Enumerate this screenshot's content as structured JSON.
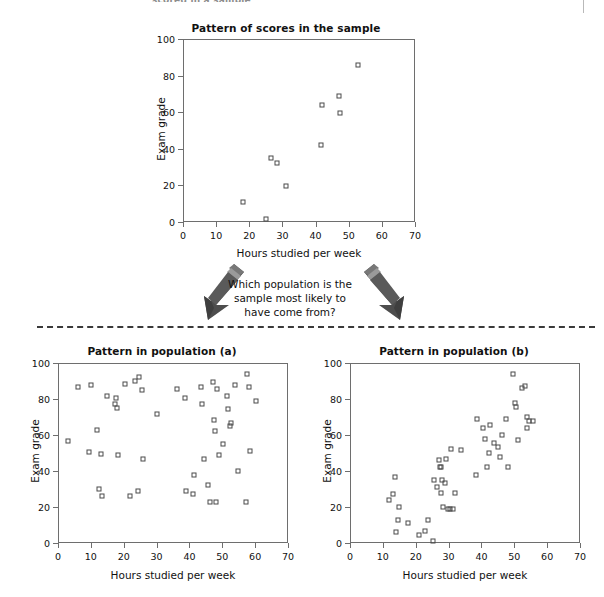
{
  "page": {
    "cropped_header_text": "scored in a sample",
    "divider_style": "dashed"
  },
  "middle": {
    "question_line1": "Which population is the",
    "question_line2": "sample most likely to",
    "question_line3": "have come from?",
    "left_arrow_name": "down-left-arrow",
    "right_arrow_name": "down-right-arrow"
  },
  "chart_data": [
    {
      "id": "sample",
      "type": "scatter",
      "title": "Pattern of scores in the sample",
      "xlabel": "Hours studied per week",
      "ylabel": "Exam grade",
      "xlim": [
        0,
        70
      ],
      "ylim": [
        0,
        100
      ],
      "xticks": [
        0,
        10,
        20,
        30,
        40,
        50,
        60,
        70
      ],
      "yticks": [
        0,
        20,
        40,
        60,
        80,
        100
      ],
      "grid": false,
      "legend": "none",
      "marker": "open-square",
      "points": [
        [
          18.2,
          11.0
        ],
        [
          25.0,
          1.5
        ],
        [
          26.7,
          35.0
        ],
        [
          28.4,
          32.5
        ],
        [
          31.2,
          19.8
        ],
        [
          41.6,
          42.0
        ],
        [
          41.8,
          63.8
        ],
        [
          47.2,
          68.8
        ],
        [
          47.3,
          59.3
        ],
        [
          52.9,
          86.0
        ]
      ]
    },
    {
      "id": "population-a",
      "type": "scatter",
      "title": "Pattern in population (a)",
      "xlabel": "Hours studied per week",
      "ylabel": "Exam grade",
      "xlim": [
        0,
        70
      ],
      "ylim": [
        0,
        100
      ],
      "xticks": [
        0,
        10,
        20,
        30,
        40,
        50,
        60,
        70
      ],
      "yticks": [
        0,
        20,
        40,
        60,
        80,
        100
      ],
      "grid": false,
      "legend": "none",
      "marker": "open-square",
      "points": [
        [
          3.0,
          56.8
        ],
        [
          6.2,
          86.7
        ],
        [
          9.3,
          50.8
        ],
        [
          10.0,
          87.8
        ],
        [
          12.0,
          62.7
        ],
        [
          12.6,
          30.0
        ],
        [
          13.2,
          49.7
        ],
        [
          13.4,
          26.3
        ],
        [
          14.8,
          81.8
        ],
        [
          17.2,
          77.3
        ],
        [
          17.8,
          80.8
        ],
        [
          18.0,
          74.8
        ],
        [
          18.3,
          48.8
        ],
        [
          20.3,
          88.2
        ],
        [
          21.8,
          26.0
        ],
        [
          23.5,
          89.8
        ],
        [
          24.3,
          28.9
        ],
        [
          24.6,
          92.2
        ],
        [
          25.7,
          85.2
        ],
        [
          26.0,
          46.8
        ],
        [
          30.0,
          71.5
        ],
        [
          36.2,
          85.8
        ],
        [
          38.8,
          80.8
        ],
        [
          39.1,
          28.8
        ],
        [
          41.2,
          27.0
        ],
        [
          41.4,
          37.8
        ],
        [
          43.5,
          86.6
        ],
        [
          43.9,
          77.3
        ],
        [
          44.4,
          46.8
        ],
        [
          45.5,
          32.0
        ],
        [
          46.2,
          23.0
        ],
        [
          47.2,
          89.5
        ],
        [
          47.4,
          68.2
        ],
        [
          47.9,
          62.0
        ],
        [
          48.2,
          23.0
        ],
        [
          48.5,
          85.4
        ],
        [
          48.9,
          48.8
        ],
        [
          50.3,
          54.8
        ],
        [
          51.5,
          81.8
        ],
        [
          51.8,
          74.5
        ],
        [
          52.2,
          64.8
        ],
        [
          52.6,
          66.8
        ],
        [
          54.0,
          87.8
        ],
        [
          54.8,
          39.8
        ],
        [
          57.3,
          23.0
        ],
        [
          57.6,
          93.8
        ],
        [
          58.0,
          86.6
        ],
        [
          58.3,
          51.3
        ],
        [
          60.3,
          79.0
        ]
      ]
    },
    {
      "id": "population-b",
      "type": "scatter",
      "title": "Pattern in population (b)",
      "xlabel": "Hours studied per week",
      "ylabel": "Exam grade",
      "xlim": [
        0,
        70
      ],
      "ylim": [
        0,
        100
      ],
      "xticks": [
        0,
        10,
        20,
        30,
        40,
        50,
        60,
        70
      ],
      "yticks": [
        0,
        20,
        40,
        60,
        80,
        100
      ],
      "grid": false,
      "legend": "none",
      "marker": "open-square",
      "points": [
        [
          12.0,
          23.8
        ],
        [
          13.2,
          27.5
        ],
        [
          13.8,
          36.8
        ],
        [
          14.1,
          6.0
        ],
        [
          14.6,
          13.0
        ],
        [
          15.0,
          19.8
        ],
        [
          17.8,
          11.0
        ],
        [
          21.0,
          4.5
        ],
        [
          22.8,
          6.5
        ],
        [
          23.6,
          13.0
        ],
        [
          25.2,
          1.0
        ],
        [
          25.6,
          35.0
        ],
        [
          26.5,
          31.3
        ],
        [
          27.0,
          46.0
        ],
        [
          27.3,
          42.0
        ],
        [
          27.6,
          27.8
        ],
        [
          27.8,
          42.2
        ],
        [
          27.9,
          35.2
        ],
        [
          28.4,
          20.2
        ],
        [
          28.8,
          33.2
        ],
        [
          29.3,
          46.8
        ],
        [
          29.8,
          19.0
        ],
        [
          30.3,
          19.0
        ],
        [
          30.6,
          52.0
        ],
        [
          31.2,
          19.0
        ],
        [
          32.0,
          28.0
        ],
        [
          33.8,
          51.5
        ],
        [
          38.2,
          38.0
        ],
        [
          38.8,
          68.8
        ],
        [
          40.6,
          63.8
        ],
        [
          41.0,
          57.8
        ],
        [
          41.6,
          42.0
        ],
        [
          42.2,
          50.0
        ],
        [
          42.6,
          65.8
        ],
        [
          43.8,
          55.5
        ],
        [
          45.0,
          53.2
        ],
        [
          45.8,
          47.8
        ],
        [
          46.2,
          59.8
        ],
        [
          47.4,
          68.8
        ],
        [
          48.2,
          42.0
        ],
        [
          49.5,
          93.8
        ],
        [
          50.3,
          77.8
        ],
        [
          50.4,
          75.8
        ],
        [
          51.0,
          57.0
        ],
        [
          52.4,
          86.0
        ],
        [
          53.4,
          87.0
        ],
        [
          53.8,
          69.8
        ],
        [
          54.0,
          64.0
        ],
        [
          54.6,
          67.8
        ],
        [
          55.8,
          68.0
        ]
      ]
    }
  ]
}
